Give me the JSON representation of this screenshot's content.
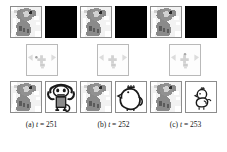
{
  "figure": {
    "type": "image-grid",
    "rows": 3,
    "columns": 3,
    "panels": [
      {
        "id": "a",
        "caption": "(a) t = 251",
        "caption_prefix": "(a)",
        "caption_var": "t",
        "caption_eq": "=",
        "caption_value": "251",
        "top_row": {
          "left_tile": "koala-source-image",
          "right_tile": "black-blank-image"
        },
        "middle_row": {
          "tile": "faint-attention-map"
        },
        "bottom_row": {
          "left_tile": "koala-source-image",
          "right_tile": "monkey-line-drawing"
        }
      },
      {
        "id": "b",
        "caption": "(b) t = 252",
        "caption_prefix": "(b)",
        "caption_var": "t",
        "caption_eq": "=",
        "caption_value": "252",
        "top_row": {
          "left_tile": "koala-source-image",
          "right_tile": "black-blank-image"
        },
        "middle_row": {
          "tile": "faint-attention-map"
        },
        "bottom_row": {
          "left_tile": "koala-source-image",
          "right_tile": "chicken-line-drawing"
        }
      },
      {
        "id": "c",
        "caption": "(c) t = 253",
        "caption_prefix": "(c)",
        "caption_var": "t",
        "caption_eq": "=",
        "caption_value": "253",
        "top_row": {
          "left_tile": "koala-source-image",
          "right_tile": "black-blank-image"
        },
        "middle_row": {
          "tile": "faint-attention-map"
        },
        "bottom_row": {
          "left_tile": "koala-source-image",
          "right_tile": "chick-line-drawing"
        }
      }
    ],
    "colors": {
      "background": "#ffffff",
      "tile_border": "#8c8c8c",
      "black_tile": "#000000",
      "koala_body": "#8a8a8a",
      "koala_dark": "#4a4a4a",
      "faint_gray": "#d9d9d9",
      "caption_text": "#141414",
      "line_art": "#1a1a1a"
    }
  }
}
